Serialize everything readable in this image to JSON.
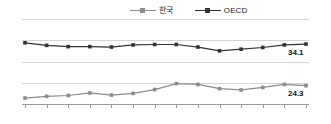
{
  "chart_data": {
    "type": "line",
    "title": "",
    "xlabel": "",
    "ylabel": "",
    "categories": [
      "2000",
      "2001",
      "2002",
      "2003",
      "2004",
      "2005",
      "2006",
      "2007",
      "2008",
      "2009",
      "2010",
      "2011",
      "2012",
      "2013"
    ],
    "ylim": [
      20,
      40
    ],
    "yticks": [
      20,
      25,
      30,
      35,
      40
    ],
    "grid": true,
    "legend_position": "top-center",
    "series": [
      {
        "name": "한국",
        "color": "#8c8c8c",
        "marker": "square",
        "values": [
          21.4,
          21.8,
          22.0,
          22.6,
          22.1,
          22.5,
          23.4,
          24.8,
          24.6,
          23.6,
          23.3,
          23.9,
          24.6,
          24.3
        ],
        "end_label": "24.3"
      },
      {
        "name": "OECD",
        "color": "#333333",
        "marker": "square",
        "values": [
          34.4,
          33.8,
          33.5,
          33.5,
          33.4,
          33.9,
          34.0,
          34.0,
          33.4,
          32.5,
          32.9,
          33.3,
          33.9,
          34.1
        ],
        "end_label": "34.1"
      }
    ]
  },
  "legend": {
    "items": [
      {
        "label": "한국",
        "color": "#8c8c8c"
      },
      {
        "label": "OECD",
        "color": "#333333"
      }
    ]
  },
  "axis": {
    "y_tick_labels": [
      "40",
      "35",
      "30",
      "25",
      "20"
    ],
    "x_tick_labels": [
      "2000",
      "2001",
      "2002",
      "2003",
      "2004",
      "2005",
      "2006",
      "2007",
      "2008",
      "2009",
      "2010",
      "2011",
      "2012",
      "2013"
    ]
  },
  "annotations": {
    "oecd_end": "34.1",
    "korea_end": "24.3"
  }
}
